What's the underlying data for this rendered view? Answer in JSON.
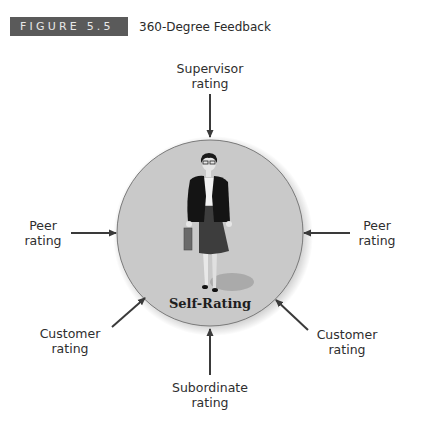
{
  "figure": {
    "number_label": "FIGURE 5.5",
    "title": "360-Degree Feedback"
  },
  "center": {
    "label": "Self-Rating",
    "illustration": "businesswoman-with-briefcase"
  },
  "inputs": [
    {
      "id": "supervisor",
      "line1": "Supervisor",
      "line2": "rating",
      "position": "top"
    },
    {
      "id": "peer-left",
      "line1": "Peer",
      "line2": "rating",
      "position": "left"
    },
    {
      "id": "peer-right",
      "line1": "Peer",
      "line2": "rating",
      "position": "right"
    },
    {
      "id": "customer-left",
      "line1": "Customer",
      "line2": "rating",
      "position": "bottom-left"
    },
    {
      "id": "customer-right",
      "line1": "Customer",
      "line2": "rating",
      "position": "bottom-right"
    },
    {
      "id": "subordinate",
      "line1": "Subordinate",
      "line2": "rating",
      "position": "bottom"
    }
  ],
  "colors": {
    "label_box": "#5a5a5a",
    "circle_fill": "#c9c9c9",
    "arrow": "#3a3a3a"
  }
}
